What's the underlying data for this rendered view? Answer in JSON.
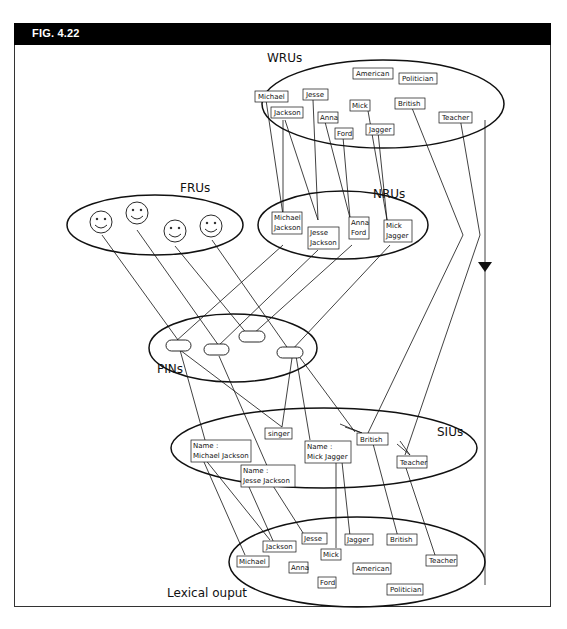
{
  "figure": {
    "label": "FIG. 4.22"
  },
  "groups": {
    "wrus": "WRUs",
    "frus": "FRUs",
    "nrus": "NRUs",
    "pins": "PINs",
    "sius": "SIUs",
    "lexical": "Lexical ouput"
  },
  "wru_words": [
    "American",
    "Politician",
    "Michael",
    "Jesse",
    "Mick",
    "British",
    "Jackson",
    "Anna",
    "Ford",
    "Jagger",
    "Teacher"
  ],
  "nru_names": [
    {
      "line1": "Michael",
      "line2": "Jackson"
    },
    {
      "line1": "Jesse",
      "line2": "Jackson"
    },
    {
      "line1": "Anna",
      "line2": "Ford"
    },
    {
      "line1": "Mick",
      "line2": "Jagger"
    }
  ],
  "siu_items": {
    "singer": "singer",
    "british": "British",
    "teacher": "Teacher",
    "name_mj": {
      "line1": "Name :",
      "line2": "Michael Jackson"
    },
    "name_jj": {
      "line1": "Name :",
      "line2": "Jesse Jackson"
    },
    "name_mick": {
      "line1": "Name :",
      "line2": "Mick Jagger"
    }
  },
  "lexical_words": [
    "Jesse",
    "Jagger",
    "British",
    "Jackson",
    "Mick",
    "Michael",
    "Anna",
    "American",
    "Teacher",
    "Ford",
    "Politician"
  ],
  "colors": {
    "ink": "#111111",
    "header_bg": "#000000",
    "header_text": "#ffffff"
  }
}
